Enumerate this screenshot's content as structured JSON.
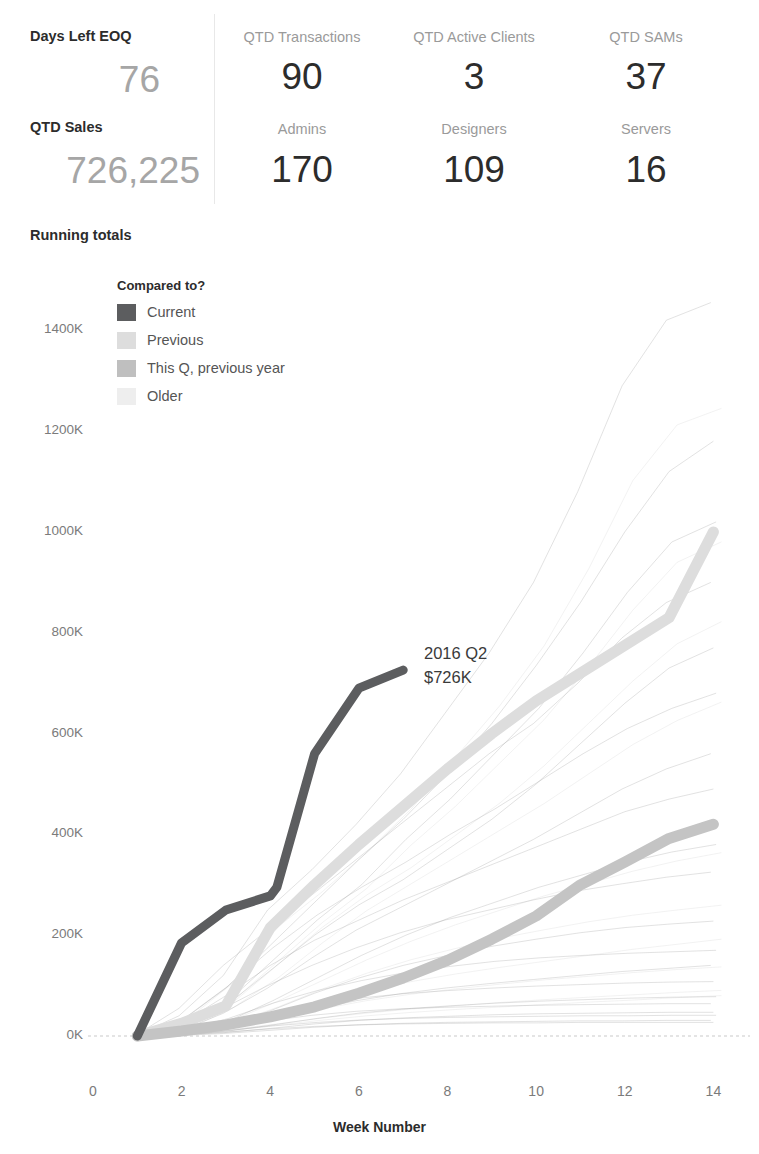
{
  "kpi": {
    "columns": [
      {
        "id": "left",
        "rows": [
          {
            "label": "Days Left EOQ",
            "value": "76"
          },
          {
            "label": "QTD Sales",
            "value": "726,225"
          }
        ]
      },
      {
        "id": "transactions",
        "rows": [
          {
            "label": "QTD Transactions",
            "value": "90"
          },
          {
            "label": "Admins",
            "value": "170"
          }
        ]
      },
      {
        "id": "clients",
        "rows": [
          {
            "label": "QTD Active Clients",
            "value": "3"
          },
          {
            "label": "Designers",
            "value": "109"
          }
        ]
      },
      {
        "id": "sams",
        "rows": [
          {
            "label": "QTD SAMs",
            "value": "37"
          },
          {
            "label": "Servers",
            "value": "16"
          }
        ]
      }
    ]
  },
  "chart_title": "Running totals",
  "legend": {
    "title": "Compared to?",
    "items": [
      {
        "label": "Current",
        "color": "#5c5d5f"
      },
      {
        "label": "Previous",
        "color": "#dddddd"
      },
      {
        "label": "This Q, previous year",
        "color": "#bfbfbf"
      },
      {
        "label": "Older",
        "color": "#eeeeee"
      }
    ]
  },
  "annotation": {
    "line1": "2016 Q2",
    "line2": "$726K"
  },
  "chart_data": {
    "type": "line",
    "title": "Running totals",
    "xlabel": "Week Number",
    "ylabel": "",
    "xlim": [
      0,
      14.6
    ],
    "ylim": [
      0,
      1480
    ],
    "xticks": [
      0,
      2,
      4,
      6,
      8,
      10,
      12,
      14
    ],
    "yticks": [
      0,
      200,
      400,
      600,
      800,
      1000,
      1200,
      1400
    ],
    "ytick_labels": [
      "0K",
      "200K",
      "400K",
      "600K",
      "800K",
      "1000K",
      "1200K",
      "1400K"
    ],
    "grid": false,
    "zero_line": true,
    "legend_position": "inside-top-left",
    "value_units": "thousands of dollars",
    "series": [
      {
        "name": "Current",
        "category": "Current",
        "color": "#5c5d5f",
        "width": 9,
        "x": [
          1,
          2,
          3,
          4,
          4.15,
          5,
          6,
          7
        ],
        "values": [
          0,
          185,
          250,
          278,
          295,
          560,
          690,
          726
        ]
      },
      {
        "name": "Previous",
        "category": "Previous",
        "color": "#dddddd",
        "width": 11,
        "x": [
          1,
          2,
          3,
          4,
          5,
          6,
          7,
          8,
          9,
          10,
          11,
          12,
          13,
          14
        ],
        "values": [
          0,
          25,
          60,
          215,
          300,
          380,
          455,
          530,
          600,
          665,
          720,
          775,
          830,
          1000
        ]
      },
      {
        "name": "This Q, previous year",
        "category": "This Q, previous year",
        "color": "#c4c4c4",
        "width": 11,
        "x": [
          1,
          2,
          3,
          4,
          5,
          6,
          7,
          8,
          9,
          10,
          11,
          12,
          13,
          14
        ],
        "values": [
          0,
          10,
          22,
          38,
          58,
          85,
          115,
          150,
          192,
          238,
          300,
          345,
          392,
          420
        ]
      }
    ],
    "background_series_note": "Faint 'Older' quarter traces drawn behind at very low opacity",
    "background_series": [
      {
        "category": "Older",
        "x": [
          1,
          2,
          3,
          4,
          5,
          6,
          7,
          8,
          9,
          10,
          11,
          12,
          13,
          14
        ],
        "values": [
          0,
          40,
          120,
          250,
          330,
          420,
          520,
          640,
          760,
          900,
          1080,
          1290,
          1420,
          1455
        ]
      },
      {
        "category": "Older",
        "x": [
          1,
          2,
          3,
          4,
          5,
          6,
          7,
          8,
          9,
          10,
          11,
          12,
          13,
          14
        ],
        "values": [
          0,
          30,
          95,
          180,
          265,
          350,
          430,
          520,
          620,
          735,
          860,
          1000,
          1120,
          1180
        ]
      },
      {
        "category": "Older",
        "x": [
          1,
          2,
          3,
          4,
          5,
          6,
          7,
          8,
          9,
          10,
          11,
          12,
          13,
          14
        ],
        "values": [
          0,
          20,
          70,
          150,
          230,
          300,
          390,
          470,
          560,
          650,
          760,
          880,
          980,
          1020
        ]
      },
      {
        "category": "Older",
        "x": [
          1,
          2,
          3,
          4,
          5,
          6,
          7,
          8,
          9,
          10,
          11,
          12,
          13,
          14
        ],
        "values": [
          0,
          55,
          140,
          210,
          280,
          350,
          420,
          490,
          560,
          620,
          700,
          790,
          860,
          900
        ]
      },
      {
        "category": "Older",
        "x": [
          1,
          2,
          3,
          4,
          5,
          6,
          7,
          8,
          9,
          10,
          11,
          12,
          13,
          14
        ],
        "values": [
          0,
          15,
          60,
          130,
          200,
          260,
          310,
          370,
          430,
          500,
          580,
          660,
          730,
          770
        ]
      },
      {
        "category": "Older",
        "x": [
          1,
          2,
          3,
          4,
          5,
          6,
          7,
          8,
          9,
          10,
          11,
          12,
          13,
          14
        ],
        "values": [
          0,
          35,
          100,
          175,
          240,
          295,
          345,
          400,
          450,
          505,
          560,
          610,
          650,
          680
        ]
      },
      {
        "category": "Older",
        "x": [
          1,
          2,
          3,
          4,
          5,
          6,
          7,
          8,
          9,
          10,
          11,
          12,
          13,
          14
        ],
        "values": [
          0,
          10,
          45,
          95,
          155,
          210,
          255,
          300,
          345,
          390,
          440,
          490,
          530,
          560
        ]
      },
      {
        "category": "Older",
        "x": [
          1,
          2,
          3,
          4,
          5,
          6,
          7,
          8,
          9,
          10,
          11,
          12,
          13,
          14
        ],
        "values": [
          0,
          25,
          80,
          140,
          190,
          230,
          270,
          305,
          340,
          375,
          410,
          445,
          470,
          490
        ]
      },
      {
        "category": "Older",
        "x": [
          1,
          2,
          3,
          4,
          5,
          6,
          7,
          8,
          9,
          10,
          11,
          12,
          13,
          14
        ],
        "values": [
          0,
          8,
          30,
          70,
          115,
          160,
          200,
          235,
          265,
          295,
          320,
          345,
          365,
          380
        ]
      },
      {
        "category": "Older",
        "x": [
          1,
          2,
          3,
          4,
          5,
          6,
          7,
          8,
          9,
          10,
          11,
          12,
          13,
          14
        ],
        "values": [
          0,
          18,
          55,
          100,
          140,
          175,
          205,
          230,
          250,
          270,
          288,
          302,
          315,
          325
        ]
      },
      {
        "category": "Older",
        "x": [
          1,
          2,
          3,
          4,
          5,
          6,
          7,
          8,
          9,
          10,
          11,
          12,
          13,
          14
        ],
        "values": [
          0,
          5,
          20,
          50,
          85,
          115,
          140,
          160,
          178,
          192,
          205,
          215,
          222,
          228
        ]
      },
      {
        "category": "Older",
        "x": [
          1,
          2,
          3,
          4,
          5,
          6,
          7,
          8,
          9,
          10,
          11,
          12,
          13,
          14
        ],
        "values": [
          0,
          12,
          35,
          65,
          90,
          110,
          126,
          138,
          148,
          155,
          160,
          164,
          167,
          170
        ]
      },
      {
        "category": "Older",
        "x": [
          1,
          2,
          3,
          4,
          5,
          6,
          7,
          8,
          9,
          10,
          11,
          12,
          13,
          14
        ],
        "values": [
          0,
          4,
          14,
          32,
          52,
          70,
          84,
          95,
          104,
          112,
          120,
          128,
          134,
          140
        ]
      },
      {
        "category": "Older",
        "x": [
          1,
          2,
          3,
          4,
          5,
          6,
          7,
          8,
          9,
          10,
          11,
          12,
          13,
          14
        ],
        "values": [
          0,
          9,
          24,
          45,
          62,
          75,
          84,
          90,
          95,
          99,
          102,
          105,
          107,
          108
        ]
      },
      {
        "category": "Older",
        "x": [
          1,
          2,
          3,
          4,
          5,
          6,
          7,
          8,
          9,
          10,
          11,
          12,
          13,
          14
        ],
        "values": [
          0,
          3,
          10,
          22,
          35,
          46,
          54,
          60,
          65,
          69,
          72,
          75,
          77,
          78
        ]
      },
      {
        "category": "Older",
        "x": [
          1,
          2,
          3,
          4,
          5,
          6,
          7,
          8,
          9,
          10,
          11,
          12,
          13,
          14
        ],
        "values": [
          0,
          6,
          16,
          30,
          41,
          49,
          54,
          57,
          59,
          61,
          62,
          63,
          64,
          64
        ]
      },
      {
        "category": "Older",
        "x": [
          1,
          2,
          3,
          4,
          5,
          6,
          7,
          8,
          9,
          10,
          11,
          12,
          13,
          14
        ],
        "values": [
          0,
          2,
          7,
          15,
          24,
          31,
          36,
          39,
          42,
          44,
          45,
          46,
          47,
          47
        ]
      },
      {
        "category": "Older",
        "x": [
          1,
          2,
          3,
          4,
          5,
          6,
          7,
          8,
          9,
          10,
          11,
          12,
          13,
          14
        ],
        "values": [
          0,
          4,
          11,
          20,
          27,
          32,
          35,
          37,
          38,
          39,
          40,
          40,
          41,
          41
        ]
      },
      {
        "category": "Older",
        "x": [
          1,
          2,
          3,
          4,
          5,
          6,
          7,
          8,
          9,
          10,
          11,
          12,
          13,
          14
        ],
        "values": [
          0,
          1,
          5,
          11,
          17,
          22,
          25,
          27,
          28,
          29,
          30,
          30,
          31,
          31
        ]
      },
      {
        "category": "Older",
        "x": [
          1,
          2,
          3,
          4,
          5,
          6,
          7,
          8,
          9,
          10,
          11,
          12,
          13,
          14
        ],
        "values": [
          0,
          3,
          8,
          14,
          19,
          22,
          24,
          25,
          26,
          26,
          27,
          27,
          27,
          27
        ]
      }
    ]
  }
}
